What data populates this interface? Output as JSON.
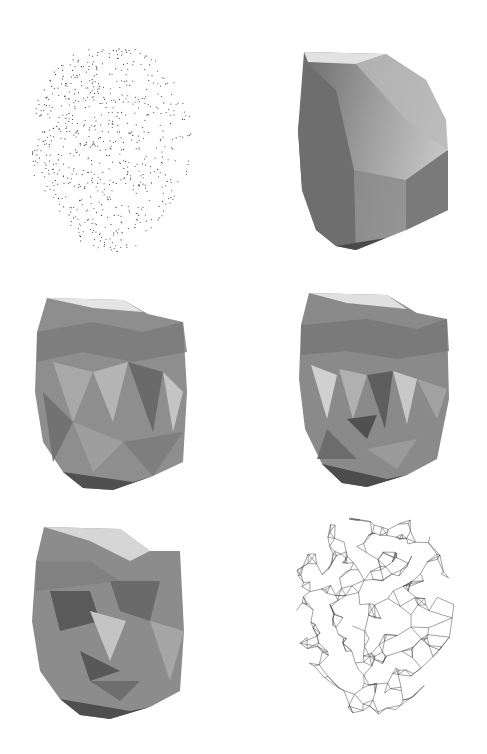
{
  "figure": {
    "layout": {
      "rows": 3,
      "cols": 2,
      "background": "#ffffff"
    },
    "panels": [
      {
        "id": "point-cloud",
        "kind": "scattered-points",
        "row": 1,
        "col": 1,
        "point_color": "#333333",
        "box": {
          "x": 32,
          "y": 48,
          "w": 165,
          "h": 204
        }
      },
      {
        "id": "convex-hull",
        "kind": "shaded-hull",
        "row": 1,
        "col": 2,
        "box": {
          "x": 296,
          "y": 50,
          "w": 160,
          "h": 200
        }
      },
      {
        "id": "mesh-stage-1",
        "kind": "shaded-mesh",
        "row": 2,
        "col": 1,
        "box": {
          "x": 33,
          "y": 292,
          "w": 156,
          "h": 200
        }
      },
      {
        "id": "mesh-stage-2",
        "kind": "shaded-mesh",
        "row": 2,
        "col": 2,
        "box": {
          "x": 297,
          "y": 289,
          "w": 158,
          "h": 200
        }
      },
      {
        "id": "mesh-refined",
        "kind": "shaded-mesh",
        "row": 3,
        "col": 1,
        "box": {
          "x": 30,
          "y": 521,
          "w": 156,
          "h": 199
        }
      },
      {
        "id": "mesh-wireframe",
        "kind": "wireframe",
        "row": 3,
        "col": 2,
        "line_color": "#444444",
        "box": {
          "x": 292,
          "y": 514,
          "w": 170,
          "h": 206
        }
      }
    ],
    "shading": {
      "dark": "#5a5a5a",
      "mid": "#8c8c8c",
      "light": "#b8b8b8",
      "highlight": "#e6e6e6"
    }
  }
}
